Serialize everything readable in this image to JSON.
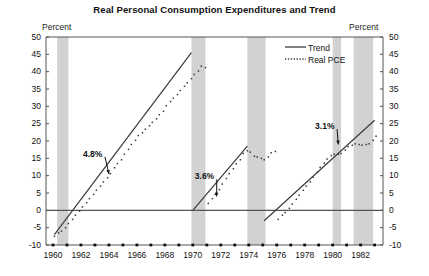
{
  "chart_data": {
    "type": "line",
    "title": "Real Personal Consumption Expenditures and Trend",
    "xlabel": "",
    "ylabel": "Percent",
    "unit_label_left": "Percent",
    "unit_label_right": "Percent",
    "xlim": [
      1959.5,
      1983.6
    ],
    "ylim": [
      -10,
      50
    ],
    "grid": false,
    "y_ticks": [
      50,
      45,
      40,
      35,
      30,
      25,
      20,
      15,
      10,
      5,
      0,
      -5,
      -10
    ],
    "y_tick_labels": [
      "50",
      "45",
      "40",
      "35",
      "30",
      "25",
      "20",
      "15",
      "10",
      "5",
      "0",
      "-5",
      "-10"
    ],
    "x_ticks": [
      1960,
      1962,
      1964,
      1966,
      1968,
      1970,
      1972,
      1974,
      1976,
      1978,
      1980,
      1982
    ],
    "x_tick_labels": [
      "1960",
      "1962",
      "1964",
      "1966",
      "1968",
      "1970",
      "1972",
      "1974",
      "1976",
      "1978",
      "1980",
      "1982"
    ],
    "x_minor_ticks": [
      1960,
      1961,
      1962,
      1963,
      1964,
      1965,
      1966,
      1967,
      1968,
      1969,
      1970,
      1971,
      1972,
      1973,
      1974,
      1975,
      1976,
      1977,
      1978,
      1979,
      1980,
      1981,
      1982,
      1983
    ],
    "legend": {
      "position": "top-right",
      "entries": [
        {
          "name": "Trend",
          "style": "solid"
        },
        {
          "name": "Real PCE",
          "style": "dotted"
        }
      ]
    },
    "zero_line": 0,
    "recession_bands": [
      {
        "start": 1960.3,
        "end": 1961.1
      },
      {
        "start": 1969.9,
        "end": 1970.9
      },
      {
        "start": 1973.9,
        "end": 1975.2
      },
      {
        "start": 1980.0,
        "end": 1980.6
      },
      {
        "start": 1981.5,
        "end": 1982.9
      }
    ],
    "annotations": [
      {
        "text": "4.8%",
        "x": 1963.0,
        "y": 16.0,
        "arrow_to_x": 1964.0,
        "arrow_to_y": 10.5
      },
      {
        "text": "3.6%",
        "x": 1971.0,
        "y": 9.5,
        "arrow_to_x": 1971.7,
        "arrow_to_y": 4.0
      },
      {
        "text": "3.1%",
        "x": 1979.6,
        "y": 24.0,
        "arrow_to_x": 1980.4,
        "arrow_to_y": 19.0
      }
    ],
    "series": [
      {
        "name": "Trend",
        "style": "solid",
        "color": "#3a3a3a",
        "segments": [
          {
            "growth_rate": "4.8%",
            "points": [
              [
                1960.1,
                -7.0
              ],
              [
                1969.9,
                45.5
              ]
            ]
          },
          {
            "growth_rate": "3.6%",
            "points": [
              [
                1970.0,
                0.0
              ],
              [
                1973.9,
                18.5
              ]
            ]
          },
          {
            "growth_rate": "3.1%",
            "points": [
              [
                1975.1,
                -3.0
              ],
              [
                1983.0,
                26.0
              ]
            ]
          }
        ]
      },
      {
        "name": "Real PCE",
        "style": "dotted",
        "color": "#3a3a3a",
        "x": [
          1960.1,
          1960.4,
          1960.6,
          1960.9,
          1961.1,
          1961.4,
          1961.6,
          1961.9,
          1962.1,
          1962.4,
          1962.6,
          1962.9,
          1963.1,
          1963.4,
          1963.6,
          1963.9,
          1964.1,
          1964.4,
          1964.6,
          1964.9,
          1965.1,
          1965.4,
          1965.6,
          1965.9,
          1966.1,
          1966.4,
          1966.6,
          1966.9,
          1967.1,
          1967.4,
          1967.6,
          1967.9,
          1968.1,
          1968.4,
          1968.6,
          1968.9,
          1969.1,
          1969.4,
          1969.6,
          1969.9,
          1970.1,
          1970.4,
          1970.6,
          1970.9,
          1971.1,
          1971.4,
          1971.6,
          1971.9,
          1972.1,
          1972.4,
          1972.6,
          1972.9,
          1973.1,
          1973.4,
          1973.6,
          1973.9,
          1974.1,
          1974.4,
          1974.6,
          1974.9,
          1975.1,
          1975.4,
          1975.6,
          1975.9,
          1976.1,
          1976.4,
          1976.6,
          1976.9,
          1977.1,
          1977.4,
          1977.6,
          1977.9,
          1978.1,
          1978.4,
          1978.6,
          1978.9,
          1979.1,
          1979.4,
          1979.6,
          1979.9,
          1980.1,
          1980.4,
          1980.6,
          1980.9,
          1981.1,
          1981.4,
          1981.6,
          1981.9,
          1982.1,
          1982.4,
          1982.6,
          1982.9,
          1983.1
        ],
        "y": [
          -7.5,
          -6.5,
          -6.0,
          -5.0,
          -3.8,
          -2.6,
          -1.4,
          -0.2,
          1.0,
          2.2,
          3.4,
          4.6,
          5.8,
          7.0,
          8.2,
          9.4,
          10.6,
          12.3,
          13.5,
          14.6,
          16.2,
          17.6,
          19.0,
          20.2,
          21.6,
          22.4,
          23.4,
          24.4,
          25.4,
          26.4,
          27.6,
          28.6,
          30.2,
          31.4,
          32.4,
          33.4,
          34.6,
          35.8,
          36.8,
          38.0,
          39.2,
          40.2,
          41.6,
          41.2,
          2.0,
          3.4,
          4.6,
          6.0,
          7.6,
          9.2,
          10.6,
          12.0,
          13.4,
          14.6,
          16.4,
          17.2,
          16.8,
          15.6,
          15.4,
          15.0,
          14.6,
          15.4,
          16.6,
          17.0,
          -2.6,
          -1.4,
          -0.6,
          0.6,
          1.8,
          3.2,
          4.4,
          5.8,
          7.0,
          8.2,
          9.6,
          11.0,
          12.4,
          13.6,
          14.8,
          15.8,
          16.2,
          16.2,
          16.4,
          17.4,
          18.4,
          18.8,
          19.2,
          19.0,
          18.8,
          19.0,
          19.2,
          20.2,
          21.4
        ]
      }
    ]
  },
  "colors": {
    "recession_band": "#d2d2d2",
    "line": "#3a3a3a",
    "axis": "#555555",
    "text": "#111111"
  }
}
